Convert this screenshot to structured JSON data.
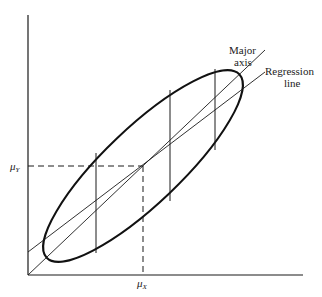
{
  "diagram": {
    "type": "bivariate-normal-ellipse",
    "labels": {
      "major_axis_line1": "Major",
      "major_axis_line2": "axis",
      "regression_line1": "Regression",
      "regression_line2": "line",
      "mu_y": "μ",
      "mu_y_sub": "Y",
      "mu_x": "μ",
      "mu_x_sub": "X"
    },
    "colors": {
      "stroke": "#1a1a1a",
      "background": "#ffffff"
    },
    "geometry": {
      "origin": [
        28,
        275
      ],
      "x_axis_end": [
        303,
        275
      ],
      "y_axis_top": [
        28,
        15
      ],
      "center": [
        143,
        166
      ],
      "ellipse_rx": 133,
      "ellipse_ry": 38,
      "ellipse_rotation_deg": -43.6,
      "major_axis": [
        [
          28,
          275
        ],
        [
          265,
          50
        ]
      ],
      "regression_line": [
        [
          28,
          252
        ],
        [
          265,
          72
        ]
      ],
      "vertical_chords": [
        {
          "x": 96,
          "y1": 153,
          "y2": 253
        },
        {
          "x": 170,
          "y1": 90,
          "y2": 201
        },
        {
          "x": 215,
          "y1": 69,
          "y2": 150
        }
      ]
    }
  }
}
